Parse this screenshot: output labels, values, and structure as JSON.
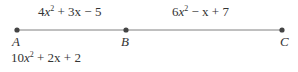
{
  "diagram": {
    "type": "line-segment",
    "points": [
      {
        "label": "A",
        "x": 17
      },
      {
        "label": "B",
        "x": 126
      },
      {
        "label": "C",
        "x": 282
      }
    ],
    "segment_labels": [
      {
        "between": "A-B",
        "coef": "4",
        "rest": " + 3x − 5"
      },
      {
        "between": "B-C",
        "coef": "6",
        "rest": " − x + 7"
      }
    ],
    "bottom_expression": {
      "coef": "10",
      "rest": " + 2x + 2"
    },
    "line_color": "#808080",
    "dot_color": "#444444"
  }
}
